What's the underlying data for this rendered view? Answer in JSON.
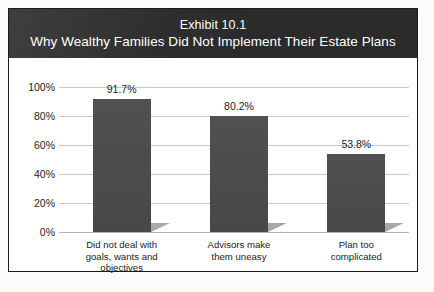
{
  "figure": {
    "title_line1": "Exhibit 10.1",
    "title_line2": "Why Wealthy Families Did Not Implement Their Estate Plans",
    "banner_color": "#2b2b2b",
    "bar_color": "#4a4a4a",
    "shadow_color": "#a9a9a9",
    "gridline_color": "#c9c9c9",
    "frame_color": "#1b1b1b"
  },
  "chart_data": {
    "type": "bar",
    "title": "Exhibit 10.1 Why Wealthy Families Did Not Implement Their Estate Plans",
    "categories": [
      "Did not deal with\ngoals, wants and\nobjectives",
      "Advisors make\nthem uneasy",
      "Plan too\ncomplicated"
    ],
    "values": [
      91.7,
      80.2,
      53.8
    ],
    "value_labels": [
      "91.7%",
      "80.2%",
      "53.8%"
    ],
    "xlabel": "",
    "ylabel": "",
    "ylim": [
      0,
      100
    ],
    "yticks": [
      0,
      20,
      40,
      60,
      80,
      100
    ],
    "ytick_labels": [
      "0%",
      "20%",
      "40%",
      "60%",
      "80%",
      "100%"
    ],
    "grid": true,
    "legend": false
  }
}
